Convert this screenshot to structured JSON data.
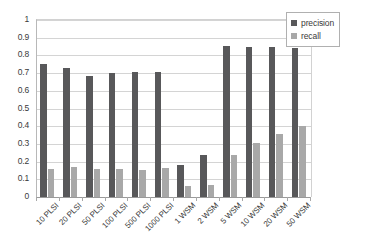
{
  "chart_data": {
    "type": "bar",
    "title": "",
    "xlabel": "",
    "ylabel": "",
    "ylim": [
      0,
      1
    ],
    "ytick_step": 0.1,
    "grid": true,
    "legend_position": "top-right",
    "categories": [
      "10 PLSI",
      "20 PLSI",
      "50 PLSI",
      "100 PLSI",
      "500 PLSI",
      "1000 PLSI",
      "1 WSM",
      "2 WSM",
      "5 WSM",
      "10 WSM",
      "20 WSM",
      "50 WSM"
    ],
    "ytick_labels": [
      "0",
      "0.1",
      "0.2",
      "0.3",
      "0.4",
      "0.5",
      "0.6",
      "0.7",
      "0.8",
      "0.9",
      "1"
    ],
    "ytick_values": [
      0,
      0.1,
      0.2,
      0.3,
      0.4,
      0.5,
      0.6,
      0.7,
      0.8,
      0.9,
      1
    ],
    "series": [
      {
        "name": "precision",
        "color": "#58585a",
        "values": [
          0.75,
          0.73,
          0.685,
          0.7,
          0.705,
          0.705,
          0.18,
          0.235,
          0.855,
          0.85,
          0.85,
          0.84
        ]
      },
      {
        "name": "recall",
        "color": "#a8a8a8",
        "values": [
          0.16,
          0.17,
          0.157,
          0.157,
          0.155,
          0.163,
          0.065,
          0.068,
          0.238,
          0.303,
          0.355,
          0.4
        ]
      }
    ]
  },
  "legend": {
    "entries": [
      {
        "label": "precision",
        "color": "#58585a"
      },
      {
        "label": "recall",
        "color": "#a8a8a8"
      }
    ]
  },
  "colors": {
    "precision": "#58585a",
    "recall": "#a8a8a8",
    "gridline": "#d4d4d4",
    "axis": "#9a9a9a",
    "text": "#3a3a3a",
    "background": "#ffffff"
  }
}
